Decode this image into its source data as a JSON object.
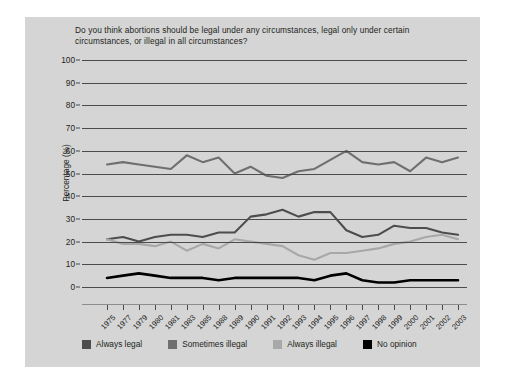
{
  "chart_data": {
    "type": "line",
    "title": "Do you think abortions should be legal under any circumstances, legal only under certain circumstances, or illegal in all circumstances?",
    "xlabel": "",
    "ylabel": "Percentage (%)",
    "ylim": [
      0,
      100
    ],
    "ytick_labels": [
      "100",
      "90",
      "80",
      "70",
      "60",
      "50",
      "40",
      "30",
      "20",
      "10",
      "0"
    ],
    "ytick_values": [
      100,
      90,
      80,
      70,
      60,
      50,
      40,
      30,
      20,
      10,
      0
    ],
    "grid": true,
    "legend_position": "bottom",
    "categories": [
      "1975",
      "1977",
      "1979",
      "1980",
      "1981",
      "1983",
      "1985",
      "1988",
      "1989",
      "1990",
      "1991",
      "1992",
      "1993",
      "1994",
      "1995",
      "1996",
      "1997",
      "1998",
      "1999",
      "2000",
      "2001",
      "2002",
      "2003"
    ],
    "series": [
      {
        "name": "Always legal",
        "color": "#4d4d4d",
        "values": [
          21,
          22,
          20,
          22,
          23,
          23,
          22,
          24,
          24,
          31,
          32,
          34,
          31,
          33,
          33,
          25,
          22,
          23,
          27,
          26,
          26,
          24,
          23
        ]
      },
      {
        "name": "Sometimes illegal",
        "color": "#6f6f6f",
        "values": [
          54,
          55,
          54,
          53,
          52,
          58,
          55,
          57,
          50,
          53,
          49,
          48,
          51,
          52,
          56,
          60,
          55,
          54,
          55,
          51,
          57,
          55,
          57
        ]
      },
      {
        "name": "Always illegal",
        "color": "#a8a8a8",
        "values": [
          21,
          19,
          19,
          18,
          20,
          16,
          19,
          17,
          21,
          20,
          19,
          18,
          14,
          12,
          15,
          15,
          16,
          17,
          19,
          20,
          22,
          23,
          21
        ]
      },
      {
        "name": "No opinion",
        "color": "#000000",
        "values": [
          4,
          5,
          6,
          5,
          4,
          4,
          4,
          3,
          4,
          4,
          4,
          4,
          4,
          3,
          5,
          6,
          3,
          2,
          2,
          3,
          3,
          3,
          3
        ]
      }
    ]
  },
  "legend": {
    "items": [
      {
        "label": "Always legal",
        "color": "#4d4d4d"
      },
      {
        "label": "Sometimes illegal",
        "color": "#6f6f6f"
      },
      {
        "label": "Always illegal",
        "color": "#a8a8a8"
      },
      {
        "label": "No opinion",
        "color": "#000000"
      }
    ]
  }
}
